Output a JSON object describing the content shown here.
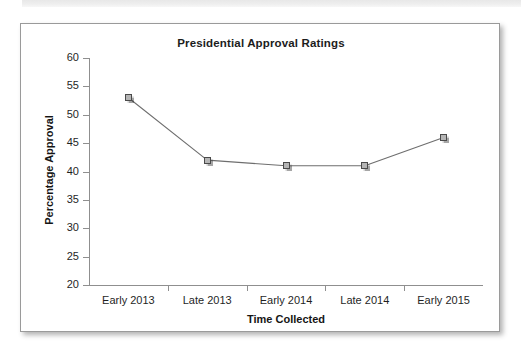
{
  "chart_data": {
    "type": "line",
    "title": "Presidential Approval Ratings",
    "xlabel": "Time Collected",
    "ylabel": "Percentage Approval",
    "categories": [
      "Early 2013",
      "Late 2013",
      "Early 2014",
      "Late 2014",
      "Early 2015"
    ],
    "values": [
      53,
      42,
      41,
      41,
      46
    ],
    "series": [
      {
        "name": "Percentage Approval",
        "values": [
          53,
          42,
          41,
          41,
          46
        ]
      }
    ],
    "ylim": [
      20,
      60
    ],
    "y_ticks": [
      60,
      55,
      50,
      45,
      40,
      35,
      30,
      25,
      20
    ],
    "y_tick_labels": [
      "60",
      "55",
      "50",
      "45",
      "40",
      "35",
      "30",
      "25",
      "20"
    ],
    "grid": false,
    "legend": "none",
    "marker_style": "square",
    "line_color": "#6e6e6e",
    "marker_fill_color": "#b5b5b5",
    "marker_border_color": "#4a4a4a"
  }
}
